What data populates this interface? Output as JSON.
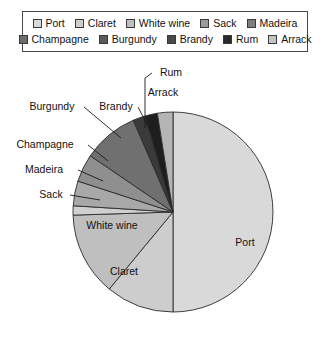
{
  "chart_data": {
    "type": "pie",
    "title": "",
    "subtitle": "",
    "xlabel": "",
    "ylabel": "",
    "grid": false,
    "legend_position": "top",
    "start_angle_deg": 0,
    "direction": "clockwise",
    "categories": [
      "Port",
      "Claret",
      "White wine",
      "Sack",
      "Madeira",
      "Champagne",
      "Burgundy",
      "Brandy",
      "Rum",
      "Arrack"
    ],
    "values": [
      50.0,
      11.0,
      13.5,
      1.5,
      4.0,
      4.5,
      9.0,
      2.0,
      2.0,
      2.5
    ],
    "units": "percent",
    "colors": [
      "#d9d9d9",
      "#cdcdcd",
      "#bfbfbf",
      "#d0d0d0",
      "#a8a8a8",
      "#8f8f8f",
      "#707070",
      "#3a3a3a",
      "#1e1e1e",
      "#b5b5b5"
    ],
    "slices": [
      {
        "label": "Port",
        "value": 50.0,
        "color": "#d9d9d9",
        "label_placement": "inside"
      },
      {
        "label": "Claret",
        "value": 11.0,
        "color": "#cdcdcd",
        "label_placement": "inside"
      },
      {
        "label": "White wine",
        "value": 13.5,
        "color": "#bfbfbf",
        "label_placement": "inside"
      },
      {
        "label": "Sack",
        "value": 1.5,
        "color": "#d0d0d0",
        "label_placement": "outside"
      },
      {
        "label": "Madeira",
        "value": 4.0,
        "color": "#a8a8a8",
        "label_placement": "outside"
      },
      {
        "label": "Champagne",
        "value": 4.5,
        "color": "#8f8f8f",
        "label_placement": "outside"
      },
      {
        "label": "Burgundy",
        "value": 9.0,
        "color": "#707070",
        "label_placement": "outside"
      },
      {
        "label": "Brandy",
        "value": 2.0,
        "color": "#3a3a3a",
        "label_placement": "outside"
      },
      {
        "label": "Rum",
        "value": 2.0,
        "color": "#1e1e1e",
        "label_placement": "outside"
      },
      {
        "label": "Arrack",
        "value": 2.5,
        "color": "#b5b5b5",
        "label_placement": "outside"
      }
    ]
  },
  "legend": {
    "rows": [
      [
        {
          "label": "Port",
          "color": "#d9d9d9"
        },
        {
          "label": "Claret",
          "color": "#cdcdcd"
        },
        {
          "label": "White wine",
          "color": "#bfbfbf"
        },
        {
          "label": "Sack",
          "color": "#9a9a9a"
        },
        {
          "label": "Madeira",
          "color": "#7e7e7e"
        }
      ],
      [
        {
          "label": "Champagne",
          "color": "#6d6d6d"
        },
        {
          "label": "Burgundy",
          "color": "#5a5a5a"
        },
        {
          "label": "Brandy",
          "color": "#4a4a4a"
        },
        {
          "label": "Rum",
          "color": "#2a2a2a"
        },
        {
          "label": "Arrack",
          "color": "#c4c4c4"
        }
      ]
    ],
    "border_color": "#4a4a4a"
  },
  "pie_labels": [
    {
      "text": "Port",
      "x": 245,
      "y": 246,
      "anchor": "middle",
      "leader": null
    },
    {
      "text": "Claret",
      "x": 124,
      "y": 275,
      "anchor": "middle",
      "leader": null
    },
    {
      "text": "White wine",
      "x": 112,
      "y": 229,
      "anchor": "middle",
      "leader": null
    },
    {
      "text": "Sack",
      "x": 51,
      "y": 198,
      "anchor": "middle",
      "leader": [
        [
          70,
          195
        ],
        [
          100,
          200
        ]
      ]
    },
    {
      "text": "Madeira",
      "x": 44,
      "y": 173,
      "anchor": "middle",
      "leader": [
        [
          78,
          170
        ],
        [
          103,
          181
        ]
      ]
    },
    {
      "text": "Champagne",
      "x": 45,
      "y": 148,
      "anchor": "middle",
      "leader": [
        [
          88,
          145
        ],
        [
          108,
          161
        ]
      ]
    },
    {
      "text": "Burgundy",
      "x": 52,
      "y": 110,
      "anchor": "middle",
      "leader": [
        [
          84,
          107
        ],
        [
          121,
          138
        ]
      ]
    },
    {
      "text": "Brandy",
      "x": 116,
      "y": 110,
      "anchor": "middle",
      "leader": [
        [
          138,
          107
        ],
        [
          151,
          132
        ]
      ]
    },
    {
      "text": "Rum",
      "x": 171,
      "y": 76,
      "anchor": "middle",
      "leader": [
        [
          152,
          73
        ],
        [
          145,
          78
        ],
        [
          145,
          128
        ]
      ]
    },
    {
      "text": "Arrack",
      "x": 163,
      "y": 96,
      "anchor": "middle",
      "leader": null
    }
  ],
  "geometry": {
    "center_x": 173,
    "center_y": 212,
    "radius": 100
  }
}
